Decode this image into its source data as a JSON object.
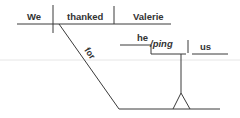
{
  "diagram": {
    "type": "sentence-diagram",
    "sentence": "We thanked Valerie for helping us",
    "main_clause": {
      "subject": "We",
      "verb": "thanked",
      "direct_object": "Valerie"
    },
    "preposition": "for",
    "gerund_phrase": {
      "gerund_part1": "he",
      "gerund_part2": "/ping",
      "object": "us"
    },
    "line_color": "#3a3a3a",
    "text_color": "#333333"
  }
}
